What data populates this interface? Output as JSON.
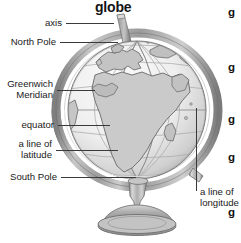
{
  "figure": {
    "title": "globe"
  },
  "labels": [
    {
      "id": "axis",
      "text": "axis",
      "lines": [
        "axis"
      ]
    },
    {
      "id": "north-pole",
      "text": "North Pole",
      "lines": [
        "North Pole"
      ]
    },
    {
      "id": "greenwich-meridian",
      "text": "Greenwich Meridian",
      "lines": [
        "Greenwich",
        "Meridian"
      ]
    },
    {
      "id": "equator",
      "text": "equator",
      "lines": [
        "equator"
      ]
    },
    {
      "id": "line-of-latitude",
      "text": "a line of latitude",
      "lines": [
        "a line of",
        "latitude"
      ]
    },
    {
      "id": "south-pole",
      "text": "South Pole",
      "lines": [
        "South Pole"
      ]
    },
    {
      "id": "line-of-longitude",
      "text": "a line of longitude",
      "lines": [
        "a line of",
        "longitude"
      ]
    }
  ],
  "label_text": {
    "axis": "axis",
    "north_pole": "North Pole",
    "greenwich_1": "Greenwich",
    "greenwich_2": "Meridian",
    "equator": "equator",
    "latitude_1": "a line of",
    "latitude_2": "latitude",
    "south_pole": "South Pole",
    "longitude_1": "a line of",
    "longitude_2": "longitude"
  },
  "glossary_column": {
    "entries": [
      "g",
      "g",
      "g",
      "g",
      "g"
    ]
  },
  "colors": {
    "text": "#1a1a1a",
    "title": "#141414",
    "leader_line": "#3a3a3a",
    "ocean": "#f2f2f2",
    "land": "#c9c9c9",
    "land_outline": "#6e6e6e",
    "grid_line": "#a8a8a8",
    "ring_dark": "#8c8c8c",
    "ring_light": "#d4d4d4",
    "stand": "#b0b0b0",
    "stand_dark": "#7d7d7d",
    "background": "#ffffff"
  }
}
